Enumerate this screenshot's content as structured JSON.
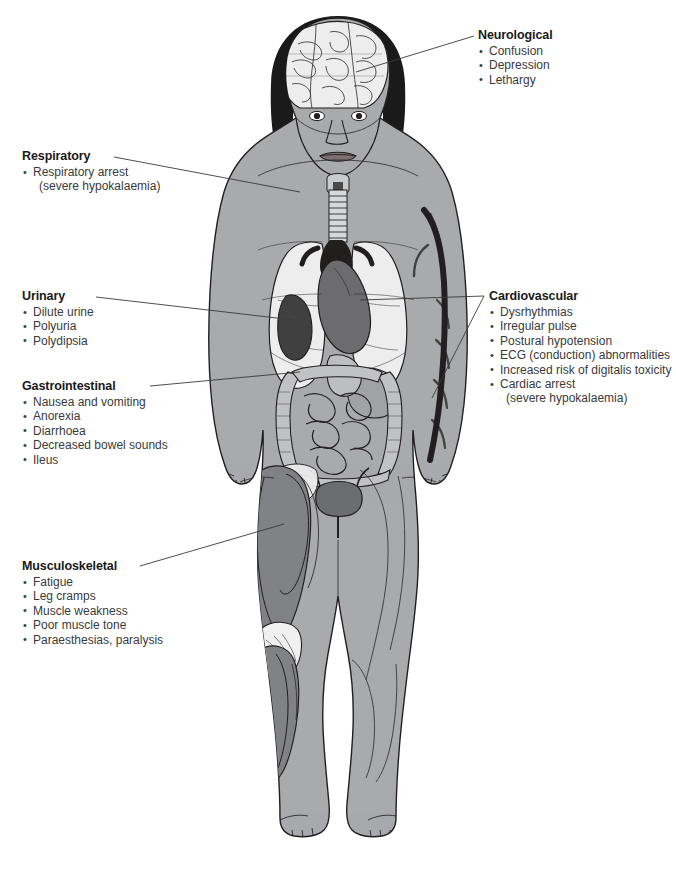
{
  "page": {
    "watermark": "",
    "width": 676,
    "height": 871
  },
  "colors": {
    "skin": "#a9aaac",
    "skin_shadow": "#939598",
    "hair": "#1a1a1a",
    "lung": "#ededee",
    "organ_mid": "#8d8f92",
    "organ_dark": "#58595b",
    "vessel_dark": "#2b2b2d",
    "muscle": "#808285",
    "muscle_light": "#b8babc",
    "bone": "#f2f2f2",
    "outline": "#231f20",
    "leader": "#3a3a3a",
    "text_heading": "#1a1a1a",
    "text_body": "#3a3a3a",
    "background": "#ffffff"
  },
  "callouts": [
    {
      "id": "neurological",
      "title": "Neurological",
      "items": [
        {
          "text": "Confusion",
          "bulleted": true,
          "sub": false
        },
        {
          "text": "Depression",
          "bulleted": true,
          "sub": false
        },
        {
          "text": "Lethargy",
          "bulleted": true,
          "sub": false
        }
      ]
    },
    {
      "id": "respiratory",
      "title": "Respiratory",
      "items": [
        {
          "text": "Respiratory arrest",
          "bulleted": true,
          "sub": false
        },
        {
          "text": "(severe hypokalaemia)",
          "bulleted": false,
          "sub": true
        }
      ]
    },
    {
      "id": "urinary",
      "title": "Urinary",
      "items": [
        {
          "text": "Dilute urine",
          "bulleted": true,
          "sub": false
        },
        {
          "text": "Polyuria",
          "bulleted": true,
          "sub": false
        },
        {
          "text": "Polydipsia",
          "bulleted": true,
          "sub": false
        }
      ]
    },
    {
      "id": "gastrointestinal",
      "title": "Gastrointestinal",
      "items": [
        {
          "text": "Nausea and vomiting",
          "bulleted": true,
          "sub": false
        },
        {
          "text": "Anorexia",
          "bulleted": true,
          "sub": false
        },
        {
          "text": "Diarrhoea",
          "bulleted": true,
          "sub": false
        },
        {
          "text": "Decreased bowel sounds",
          "bulleted": true,
          "sub": false
        },
        {
          "text": "Ileus",
          "bulleted": true,
          "sub": false
        }
      ]
    },
    {
      "id": "musculoskeletal",
      "title": "Musculoskeletal",
      "items": [
        {
          "text": "Fatigue",
          "bulleted": true,
          "sub": false
        },
        {
          "text": "Leg cramps",
          "bulleted": true,
          "sub": false
        },
        {
          "text": "Muscle weakness",
          "bulleted": true,
          "sub": false
        },
        {
          "text": "Poor muscle tone",
          "bulleted": true,
          "sub": false
        },
        {
          "text": "Paraesthesias, paralysis",
          "bulleted": true,
          "sub": false
        }
      ]
    },
    {
      "id": "cardiovascular",
      "title": "Cardiovascular",
      "items": [
        {
          "text": "Dysrhythmias",
          "bulleted": true,
          "sub": false
        },
        {
          "text": "Irregular pulse",
          "bulleted": true,
          "sub": false
        },
        {
          "text": "Postural hypotension",
          "bulleted": true,
          "sub": false
        },
        {
          "text": "ECG (conduction) abnormalities",
          "bulleted": true,
          "sub": false
        },
        {
          "text": "Increased risk of digitalis toxicity",
          "bulleted": true,
          "sub": false
        },
        {
          "text": "Cardiac arrest",
          "bulleted": true,
          "sub": false
        },
        {
          "text": "(severe hypokalaemia)",
          "bulleted": false,
          "sub": true
        }
      ]
    }
  ],
  "anatomy": {
    "figure": "female-anatomical-figure-anterior",
    "structures": [
      "brain",
      "eyes",
      "nose",
      "mouth",
      "hair",
      "trachea",
      "larynx",
      "lungs",
      "heart",
      "aorta",
      "kidney",
      "stomach",
      "liver",
      "small-intestine",
      "large-intestine",
      "bladder",
      "arm-vessels",
      "thigh-muscles",
      "calf-muscles",
      "patella",
      "feet"
    ]
  }
}
